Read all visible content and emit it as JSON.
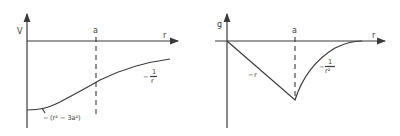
{
  "panels": [
    {
      "id": "potential",
      "y_axis_label": "V",
      "x_axis_label": "r",
      "boundary_label": "a",
      "inner_region_formula": {
        "prefix": "−",
        "text": "(r² − 3a²)"
      },
      "outer_region_formula": {
        "prefix": "−",
        "numerator": "1",
        "denominator": "r"
      }
    },
    {
      "id": "field",
      "y_axis_label": "g",
      "x_axis_label": "r",
      "boundary_label": "a",
      "inner_region_formula": {
        "prefix": "−",
        "text": "r"
      },
      "outer_region_formula": {
        "prefix": "−",
        "numerator": "1",
        "denominator": "r²"
      }
    }
  ],
  "colors": {
    "ink": "#3a3a3a",
    "background": "#ffffff"
  }
}
